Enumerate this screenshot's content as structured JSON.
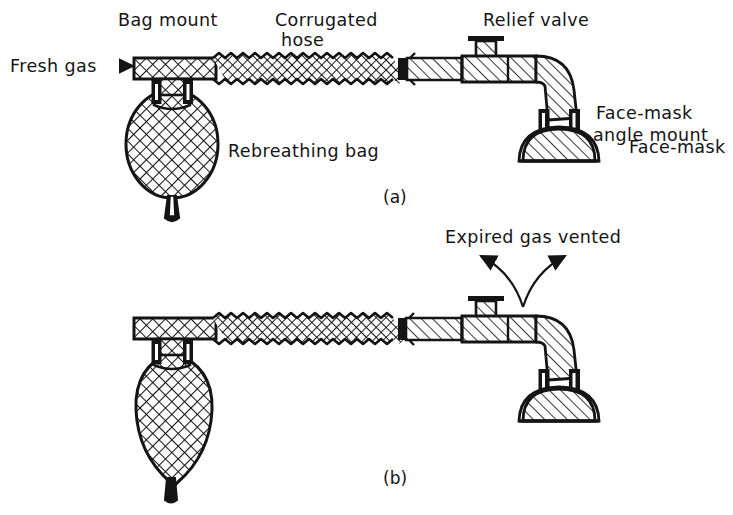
{
  "figure": {
    "type": "technical-line-diagram",
    "background_color": "#ffffff",
    "ink_color": "#141414",
    "panels": [
      {
        "id": "a",
        "label": "(a)",
        "state": "inspiration - fresh gas fills bag, bag inflated"
      },
      {
        "id": "b",
        "label": "(b)",
        "state": "expiration - expired gas vented at relief valve, bag deflated"
      }
    ],
    "labels": {
      "fresh_gas": "Fresh gas",
      "fresh_gas_arrow": "right-arrow-glyph",
      "bag_mount": "Bag mount",
      "corrugated_hose_line1": "Corrugated",
      "corrugated_hose_line2": "hose",
      "relief_valve": "Relief valve",
      "face_mask_angle_mount_line1": "Face-mask",
      "face_mask_angle_mount_line2": "angle mount",
      "face_mask": "Face-mask",
      "rebreathing_bag": "Rebreathing bag",
      "expired_gas_vented": "Expired gas vented",
      "panel_a": "(a)",
      "panel_b": "(b)"
    },
    "components": [
      {
        "name": "fresh-gas-inlet",
        "hatch": "cross-hatch"
      },
      {
        "name": "bag-mount-tee",
        "hatch": "cross-hatch"
      },
      {
        "name": "rebreathing-bag",
        "hatch": "cross-hatch"
      },
      {
        "name": "corrugated-hose",
        "hatch": "cross-hatch-corrugated"
      },
      {
        "name": "hose-connector",
        "hatch": "diagonal"
      },
      {
        "name": "relief-valve",
        "hatch": "diagonal"
      },
      {
        "name": "face-mask-angle-mount",
        "hatch": "diagonal"
      },
      {
        "name": "face-mask",
        "hatch": "diagonal"
      }
    ]
  }
}
